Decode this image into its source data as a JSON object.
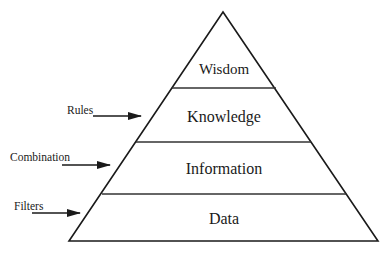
{
  "diagram": {
    "type": "pyramid",
    "layers": [
      {
        "label": "Wisdom"
      },
      {
        "label": "Knowledge"
      },
      {
        "label": "Information"
      },
      {
        "label": "Data"
      }
    ],
    "inputs": [
      {
        "label": "Rules",
        "target": "Knowledge"
      },
      {
        "label": "Combination",
        "target": "Information"
      },
      {
        "label": "Filters",
        "target": "Data"
      }
    ]
  },
  "colors": {
    "stroke": "#1a1a1a",
    "background": "#ffffff"
  }
}
